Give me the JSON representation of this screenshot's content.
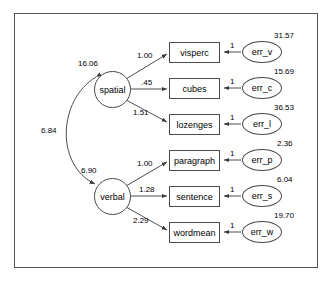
{
  "page": {
    "clipped_header_text": "",
    "frame_color": "#555555",
    "line_color": "#4a4a4a"
  },
  "diagram": {
    "type": "sem-path-diagram",
    "latents": [
      {
        "id": "spatial",
        "label": "spatial",
        "variance": "16.06"
      },
      {
        "id": "verbal",
        "label": "verbal",
        "variance": "6.90"
      }
    ],
    "covariance": {
      "between": "spatial-verbal",
      "value": "6.84"
    },
    "indicators": [
      {
        "id": "visperc",
        "label": "visperc",
        "loading": "1.00",
        "factor": "spatial",
        "error_label": "err_v",
        "error_variance": "31.57",
        "error_path": "1"
      },
      {
        "id": "cubes",
        "label": "cubes",
        "loading": ".45",
        "factor": "spatial",
        "error_label": "err_c",
        "error_variance": "15.69",
        "error_path": "1"
      },
      {
        "id": "lozenges",
        "label": "lozenges",
        "loading": "1.51",
        "factor": "spatial",
        "error_label": "err_l",
        "error_variance": "36.53",
        "error_path": "1"
      },
      {
        "id": "paragraph",
        "label": "paragraph",
        "loading": "1.00",
        "factor": "verbal",
        "error_label": "err_p",
        "error_variance": "2.36",
        "error_path": "1"
      },
      {
        "id": "sentence",
        "label": "sentence",
        "loading": "1.28",
        "factor": "verbal",
        "error_label": "err_s",
        "error_variance": "6.04",
        "error_path": "1"
      },
      {
        "id": "wordmean",
        "label": "wordmean",
        "loading": "2.29",
        "factor": "verbal",
        "error_label": "err_w",
        "error_variance": "19.70",
        "error_path": "1"
      }
    ]
  }
}
